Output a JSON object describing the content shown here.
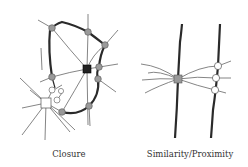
{
  "diagrams": [
    {
      "id": "closure",
      "caption": "Closure"
    },
    {
      "id": "similarity",
      "caption": "Similarity/Proximity"
    }
  ],
  "colors": {
    "thick_line": "#2a2a2a",
    "thin_line": "#555555",
    "gray_node": "#999999",
    "dark_node": "#222222",
    "white_node": "#ffffff"
  }
}
